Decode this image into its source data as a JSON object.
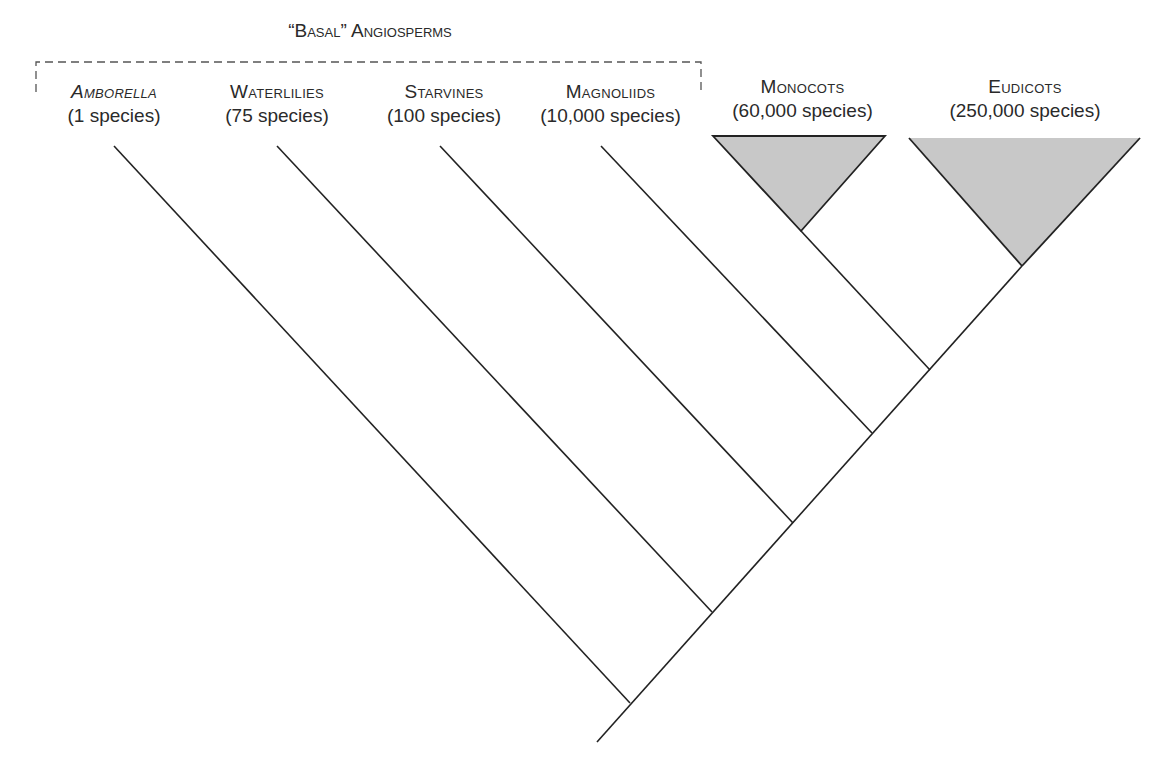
{
  "group_label": "“Basal” Angiosperms",
  "taxa": [
    {
      "name": "Amborella",
      "count": "(1 species)",
      "italic": true
    },
    {
      "name": "Waterlilies",
      "count": "(75 species)"
    },
    {
      "name": "Starvines",
      "count": "(100 species)"
    },
    {
      "name": "Magnoliids",
      "count": "(10,000 species)"
    },
    {
      "name": "Monocots",
      "count": "(60,000 species)"
    },
    {
      "name": "Eudicots",
      "count": "(250,000 species)"
    }
  ],
  "colors": {
    "line": "#222222",
    "clade_fill": "#c8c8c8",
    "dashed_box": "#555555"
  }
}
